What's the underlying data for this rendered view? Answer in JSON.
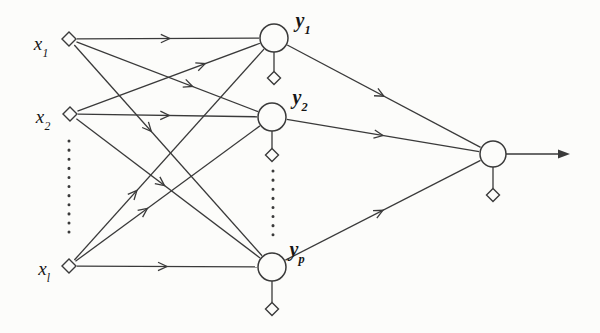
{
  "diagram": {
    "background": "#fcfcfa",
    "stroke_color": "#3a3a3a",
    "label_color": "#161616",
    "nodes": [
      {
        "id": "x1",
        "kind": "input",
        "x": 69,
        "y": 39,
        "label_base": "x",
        "label_sub": "1",
        "label_x": 41,
        "label_y": 43
      },
      {
        "id": "x2",
        "kind": "input",
        "x": 70,
        "y": 114,
        "label_base": "x",
        "label_sub": "2",
        "label_x": 43,
        "label_y": 116
      },
      {
        "id": "xl",
        "kind": "input",
        "x": 69,
        "y": 266,
        "label_base": "x",
        "label_sub": "l",
        "label_x": 44,
        "label_y": 268
      },
      {
        "id": "y1",
        "kind": "hidden",
        "x": 274,
        "y": 38,
        "r": 14,
        "bias_y": 78,
        "label_base": "y",
        "label_sub": "1",
        "label_x": 303,
        "label_y": 20
      },
      {
        "id": "y2",
        "kind": "hidden",
        "x": 272,
        "y": 117,
        "r": 14,
        "bias_y": 155,
        "label_base": "y",
        "label_sub": "2",
        "label_x": 300,
        "label_y": 97
      },
      {
        "id": "yp",
        "kind": "hidden",
        "x": 272,
        "y": 267,
        "r": 14,
        "bias_y": 309,
        "label_base": "y",
        "label_sub": "p",
        "label_x": 297,
        "label_y": 249
      },
      {
        "id": "out",
        "kind": "output",
        "x": 493,
        "y": 154,
        "r": 13,
        "bias_y": 195
      }
    ],
    "edges": [
      {
        "from": "x1",
        "to": "y1",
        "arrow_t": 0.51
      },
      {
        "from": "x1",
        "to": "y2",
        "arrow_t": 0.64
      },
      {
        "from": "x1",
        "to": "yp",
        "arrow_t": 0.41
      },
      {
        "from": "x2",
        "to": "y1",
        "arrow_t": 0.7
      },
      {
        "from": "x2",
        "to": "y2",
        "arrow_t": 0.51
      },
      {
        "from": "x2",
        "to": "yp",
        "arrow_t": 0.48
      },
      {
        "from": "xl",
        "to": "y1",
        "arrow_t": 0.33
      },
      {
        "from": "xl",
        "to": "y2",
        "arrow_t": 0.39
      },
      {
        "from": "xl",
        "to": "yp",
        "arrow_t": 0.5
      },
      {
        "from": "y1",
        "to": "out",
        "arrow_t": 0.5
      },
      {
        "from": "y2",
        "to": "out",
        "arrow_t": 0.5
      },
      {
        "from": "yp",
        "to": "out",
        "arrow_t": 0.5
      }
    ],
    "dotted_lines": [
      {
        "x": 69,
        "y_start": 141,
        "y_end": 240
      },
      {
        "x": 273,
        "y_start": 171,
        "y_end": 238
      }
    ],
    "output_arrow": {
      "from_x": 506,
      "to_x": 570,
      "y": 154
    }
  }
}
